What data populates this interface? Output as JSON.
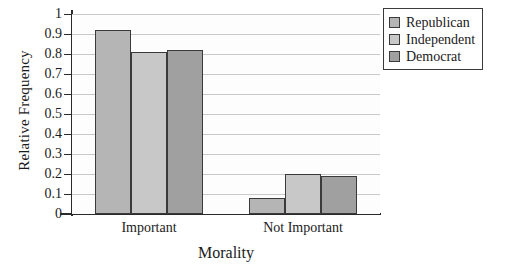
{
  "chart_data": {
    "type": "bar",
    "title": "",
    "xlabel": "Morality",
    "ylabel": "Relative Frequency",
    "categories": [
      "Important",
      "Not Important"
    ],
    "series": [
      {
        "name": "Republican",
        "values": [
          0.92,
          0.08
        ],
        "color": "#b5b5b5"
      },
      {
        "name": "Independent",
        "values": [
          0.81,
          0.2
        ],
        "color": "#c8c8c8"
      },
      {
        "name": "Democrat",
        "values": [
          0.82,
          0.19
        ],
        "color": "#a0a0a0"
      }
    ],
    "ylim": [
      0,
      1
    ],
    "yticks": [
      "0",
      "0.1",
      "0.2",
      "0.3",
      "0.4",
      "0.5",
      "0.6",
      "0.7",
      "0.8",
      "0.9",
      "1"
    ],
    "grid": true,
    "legend_position": "upper-right",
    "bar_border_color": "#3a3a3a",
    "gridline_color": "#c9c9c9",
    "axis_color": "#2a2a2a",
    "plot_background": "#fdfdfd"
  },
  "legend": {
    "entries": [
      {
        "label": "Republican"
      },
      {
        "label": "Independent"
      },
      {
        "label": "Democrat"
      }
    ]
  }
}
